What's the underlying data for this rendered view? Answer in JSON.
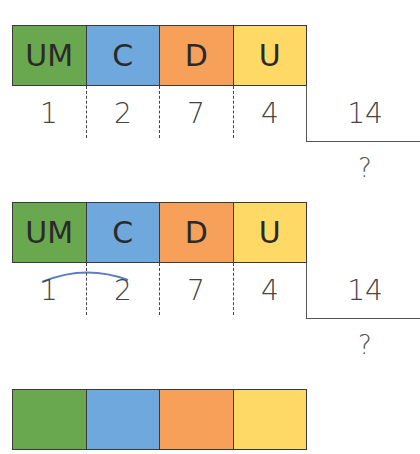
{
  "colors": {
    "um": "#6aa84f",
    "c": "#6fa8dc",
    "d": "#f6a05a",
    "u": "#ffd966",
    "arc": "#5b7ec0"
  },
  "headers": [
    "UM",
    "C",
    "D",
    "U"
  ],
  "blocks": [
    {
      "dividend_digits": [
        "1",
        "2",
        "7",
        "4"
      ],
      "divisor": "14",
      "quotient": "?",
      "arc_over": false
    },
    {
      "dividend_digits": [
        "1",
        "2",
        "7",
        "4"
      ],
      "divisor": "14",
      "quotient": "?",
      "arc_over": true
    }
  ]
}
